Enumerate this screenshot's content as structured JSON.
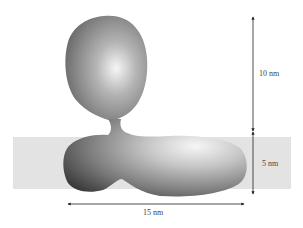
{
  "diagram": {
    "type": "protein-membrane-schematic",
    "colors": {
      "background": "#ffffff",
      "membrane": "#e3e3e3",
      "protein_dark": "#3a3a3a",
      "protein_mid": "#8a8a8a",
      "protein_highlight": "#f4f4f4",
      "arrow": "#222222"
    },
    "dimensions": {
      "height_above": "10 nm",
      "membrane_thickness": "5 nm",
      "width": "15 nm"
    }
  }
}
